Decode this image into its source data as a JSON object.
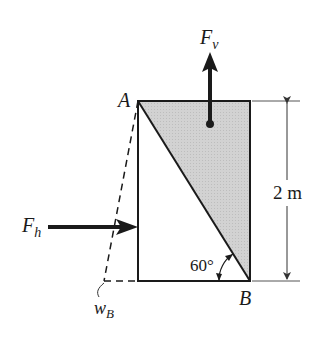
{
  "diagram": {
    "type": "free-body / gate diagram",
    "points": {
      "A": {
        "label": "A"
      },
      "B": {
        "label": "B"
      },
      "wB": {
        "label": "w",
        "subscript": "B"
      }
    },
    "forces": {
      "vertical": {
        "label": "F",
        "subscript": "v",
        "direction": "up"
      },
      "horizontal": {
        "label": "F",
        "subscript": "h",
        "direction": "right"
      }
    },
    "dimension": {
      "label": "2 m"
    },
    "angle": {
      "label": "60°"
    },
    "colors": {
      "line": "#1a1a1a",
      "shade": "#cfcfcf",
      "dim_line": "#555555"
    }
  }
}
